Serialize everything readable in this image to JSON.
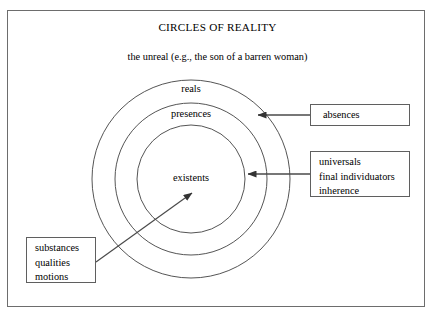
{
  "diagram": {
    "title": "CIRCLES OF REALITY",
    "unreal_note": "the unreal (e.g., the son of a barren woman)",
    "circles": [
      {
        "name": "reals",
        "label": "reals"
      },
      {
        "name": "presences",
        "label": "presences"
      },
      {
        "name": "existents",
        "label": "existents"
      }
    ],
    "callouts": {
      "absences": {
        "lines": [
          "absences"
        ],
        "points_to": "presences"
      },
      "universals": {
        "lines": [
          "universals",
          "final individuators",
          "inherence"
        ],
        "points_to": "existents"
      },
      "substances": {
        "lines": [
          "substances",
          "qualities",
          "motions"
        ],
        "points_to": "existents"
      }
    }
  },
  "colors": {
    "frame_border": "#6d6d6d",
    "circle_stroke": "#555555",
    "box_border": "#5f5f5f",
    "arrow": "#4a4a4a",
    "text": "#000000",
    "background": "#ffffff"
  }
}
